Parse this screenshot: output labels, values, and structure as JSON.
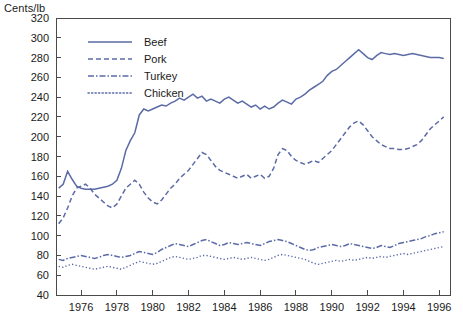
{
  "y_axis_title": "Cents/lb",
  "colors": {
    "series_line": "#5b6ba6",
    "axis": "#4a4a4a",
    "text": "#1a1a1a",
    "background": "#ffffff"
  },
  "legend": {
    "position": "top-left-inside",
    "entries": [
      {
        "label": "Beef",
        "style": "solid"
      },
      {
        "label": "Pork",
        "style": "dashed"
      },
      {
        "label": "Turkey",
        "style": "dash-dot"
      },
      {
        "label": "Chicken",
        "style": "dotted"
      }
    ]
  },
  "chart_data": {
    "type": "line",
    "title": "",
    "subtitle": "",
    "xlabel": "",
    "ylabel": "Cents/lb",
    "ylim": [
      40,
      320
    ],
    "xlim": [
      1974.6,
      1996.6
    ],
    "grid": false,
    "y_ticks": [
      40,
      60,
      80,
      100,
      120,
      140,
      160,
      180,
      200,
      220,
      240,
      260,
      280,
      300,
      320
    ],
    "x_ticks": [
      1976,
      1978,
      1980,
      1982,
      1984,
      1986,
      1988,
      1990,
      1992,
      1994,
      1996
    ],
    "x_tick_labels": [
      "1976",
      "1978",
      "1980",
      "1982",
      "1984",
      "1986",
      "1988",
      "1990",
      "1992",
      "1994",
      "1996"
    ],
    "y_tick_labels": [
      "40",
      "60",
      "80",
      "100",
      "120",
      "140",
      "160",
      "180",
      "200",
      "220",
      "240",
      "260",
      "280",
      "300",
      "320"
    ],
    "x": [
      1974.75,
      1975.0,
      1975.25,
      1975.5,
      1975.75,
      1976.0,
      1976.25,
      1976.5,
      1976.75,
      1977.0,
      1977.25,
      1977.5,
      1977.75,
      1978.0,
      1978.25,
      1978.5,
      1978.75,
      1979.0,
      1979.25,
      1979.5,
      1979.75,
      1980.0,
      1980.25,
      1980.5,
      1980.75,
      1981.0,
      1981.25,
      1981.5,
      1981.75,
      1982.0,
      1982.25,
      1982.5,
      1982.75,
      1983.0,
      1983.25,
      1983.5,
      1983.75,
      1984.0,
      1984.25,
      1984.5,
      1984.75,
      1985.0,
      1985.25,
      1985.5,
      1985.75,
      1986.0,
      1986.25,
      1986.5,
      1986.75,
      1987.0,
      1987.25,
      1987.5,
      1987.75,
      1988.0,
      1988.25,
      1988.5,
      1988.75,
      1989.0,
      1989.25,
      1989.5,
      1989.75,
      1990.0,
      1990.25,
      1990.5,
      1990.75,
      1991.0,
      1991.25,
      1991.5,
      1991.75,
      1992.0,
      1992.25,
      1992.5,
      1992.75,
      1993.0,
      1993.25,
      1993.5,
      1993.75,
      1994.0,
      1994.25,
      1994.5,
      1994.75,
      1995.0,
      1995.25,
      1995.5,
      1995.75,
      1996.0,
      1996.25
    ],
    "series": [
      {
        "name": "Beef",
        "style": "solid",
        "color": "#5b6ba6",
        "values": [
          148,
          152,
          165,
          157,
          150,
          148,
          147,
          147,
          147,
          148,
          149,
          150,
          152,
          156,
          168,
          186,
          196,
          204,
          222,
          228,
          226,
          228,
          230,
          232,
          231,
          234,
          236,
          239,
          237,
          240,
          243,
          239,
          241,
          236,
          238,
          236,
          234,
          238,
          240,
          237,
          234,
          236,
          233,
          230,
          232,
          228,
          231,
          228,
          230,
          234,
          237,
          235,
          233,
          238,
          240,
          243,
          247,
          250,
          253,
          256,
          262,
          266,
          268,
          272,
          276,
          280,
          284,
          288,
          284,
          280,
          278,
          282,
          285,
          284,
          283,
          284,
          283,
          282,
          283,
          284,
          283,
          282,
          281,
          280,
          280,
          280,
          279
        ]
      },
      {
        "name": "Pork",
        "style": "dashed",
        "color": "#5b6ba6",
        "values": [
          112,
          118,
          128,
          140,
          148,
          150,
          152,
          148,
          142,
          138,
          134,
          130,
          128,
          132,
          140,
          148,
          152,
          156,
          152,
          144,
          138,
          134,
          132,
          136,
          142,
          148,
          152,
          158,
          162,
          166,
          172,
          178,
          184,
          182,
          176,
          170,
          166,
          164,
          162,
          160,
          158,
          160,
          162,
          158,
          160,
          162,
          158,
          160,
          168,
          182,
          188,
          186,
          180,
          176,
          174,
          172,
          174,
          176,
          174,
          178,
          182,
          186,
          192,
          198,
          204,
          210,
          214,
          216,
          212,
          206,
          200,
          196,
          192,
          190,
          188,
          188,
          187,
          187,
          188,
          190,
          192,
          196,
          202,
          208,
          212,
          216,
          220
        ]
      },
      {
        "name": "Turkey",
        "style": "dash-dot",
        "color": "#5b6ba6",
        "values": [
          76,
          75,
          77,
          78,
          79,
          80,
          79,
          78,
          77,
          78,
          80,
          81,
          80,
          79,
          78,
          79,
          80,
          82,
          84,
          83,
          82,
          81,
          83,
          86,
          88,
          90,
          92,
          91,
          90,
          89,
          91,
          93,
          95,
          96,
          94,
          92,
          90,
          91,
          93,
          92,
          91,
          92,
          93,
          92,
          91,
          90,
          92,
          94,
          95,
          96,
          95,
          94,
          92,
          90,
          88,
          86,
          85,
          86,
          88,
          89,
          90,
          91,
          90,
          89,
          90,
          92,
          91,
          90,
          89,
          88,
          87,
          88,
          90,
          89,
          88,
          90,
          92,
          93,
          94,
          95,
          96,
          97,
          99,
          100,
          102,
          103,
          104
        ]
      },
      {
        "name": "Chicken",
        "style": "dotted",
        "color": "#5b6ba6",
        "values": [
          69,
          68,
          70,
          71,
          70,
          69,
          68,
          67,
          66,
          67,
          68,
          69,
          68,
          67,
          66,
          68,
          70,
          72,
          74,
          73,
          72,
          71,
          72,
          74,
          76,
          78,
          79,
          78,
          77,
          76,
          77,
          78,
          80,
          80,
          79,
          78,
          77,
          76,
          77,
          78,
          77,
          76,
          77,
          78,
          77,
          76,
          75,
          76,
          78,
          80,
          81,
          80,
          79,
          78,
          77,
          76,
          74,
          72,
          71,
          72,
          73,
          74,
          75,
          74,
          75,
          76,
          75,
          76,
          77,
          78,
          77,
          78,
          79,
          78,
          79,
          80,
          81,
          82,
          81,
          82,
          83,
          84,
          85,
          86,
          87,
          88,
          89
        ]
      }
    ]
  }
}
